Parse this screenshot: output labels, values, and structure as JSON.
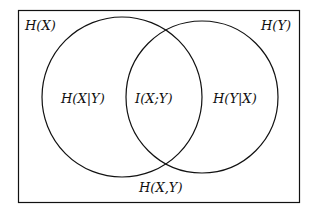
{
  "diagram": {
    "type": "venn",
    "universe_label": "H(X,Y)",
    "sets": [
      {
        "name": "X",
        "label": "H(X)",
        "exclusive_label": "H(X|Y)"
      },
      {
        "name": "Y",
        "label": "H(Y)",
        "exclusive_label": "H(Y|X)"
      }
    ],
    "intersection_label": "I(X;Y)",
    "colors": {
      "stroke": "#111111",
      "background": "#ffffff"
    }
  }
}
